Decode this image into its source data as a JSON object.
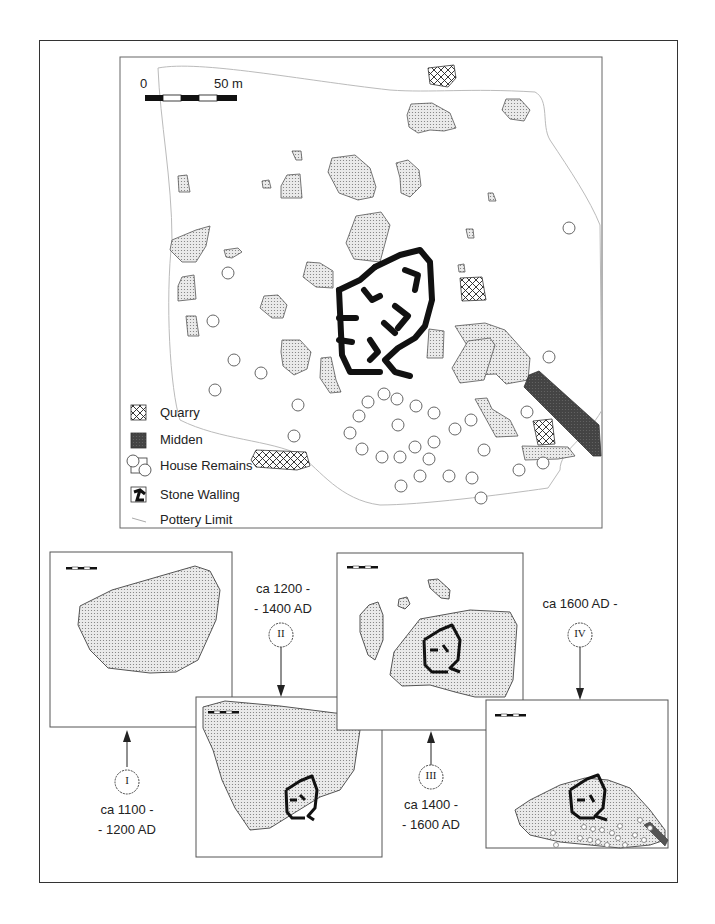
{
  "main_map": {
    "scale": {
      "start_label": "0",
      "end_label": "50 m"
    },
    "legend": [
      {
        "key": "quarry",
        "label": "Quarry"
      },
      {
        "key": "midden",
        "label": "Midden"
      },
      {
        "key": "house_remains",
        "label": "House Remains"
      },
      {
        "key": "stone_walling",
        "label": "Stone Walling"
      },
      {
        "key": "pottery_limit",
        "label": "Pottery Limit"
      }
    ]
  },
  "phases": [
    {
      "numeral": "I",
      "line1": "ca 1100 -",
      "line2": "- 1200 AD"
    },
    {
      "numeral": "II",
      "line1": "ca 1200 -",
      "line2": "- 1400 AD"
    },
    {
      "numeral": "III",
      "line1": "ca 1400 -",
      "line2": "- 1600 AD"
    },
    {
      "numeral": "IV",
      "line1": "ca 1600 AD -",
      "line2": ""
    }
  ],
  "inset_scale": {
    "start_label": "0",
    "end_label": "50 m"
  },
  "colors": {
    "stipple_fill": "#d8d8d8",
    "midden": "#555555",
    "wall": "#111111",
    "outline": "#555555"
  }
}
